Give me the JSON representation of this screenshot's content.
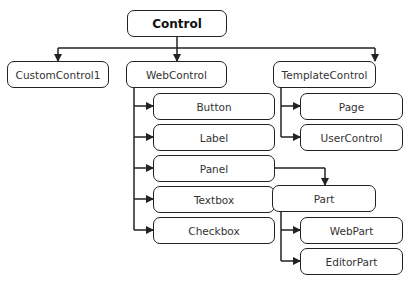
{
  "diagram": {
    "nodes": {
      "control": "Control",
      "custom_control1": "CustomControl1",
      "web_control": "WebControl",
      "template_control": "TemplateControl",
      "button": "Button",
      "label": "Label",
      "panel": "Panel",
      "textbox": "Textbox",
      "checkbox": "Checkbox",
      "page": "Page",
      "user_control": "UserControl",
      "part": "Part",
      "web_part": "WebPart",
      "editor_part": "EditorPart"
    },
    "edges": [
      [
        "Control",
        "CustomControl1"
      ],
      [
        "Control",
        "WebControl"
      ],
      [
        "Control",
        "TemplateControl"
      ],
      [
        "WebControl",
        "Button"
      ],
      [
        "WebControl",
        "Label"
      ],
      [
        "WebControl",
        "Panel"
      ],
      [
        "WebControl",
        "Textbox"
      ],
      [
        "WebControl",
        "Checkbox"
      ],
      [
        "TemplateControl",
        "Page"
      ],
      [
        "TemplateControl",
        "UserControl"
      ],
      [
        "Panel",
        "Part"
      ],
      [
        "Part",
        "WebPart"
      ],
      [
        "Part",
        "EditorPart"
      ]
    ],
    "colors": {
      "line": "#222222",
      "text": "#333333",
      "background": "#ffffff"
    }
  }
}
